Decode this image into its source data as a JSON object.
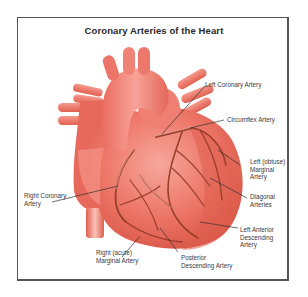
{
  "title": "Coronary Arteries of the Heart",
  "colors": {
    "heart_light": "#f48a80",
    "heart_mid": "#e8675a",
    "heart_dark": "#c9473a",
    "artery": "#9a3f2c",
    "frame": "#555555",
    "text": "#3a3a3a"
  },
  "labels": {
    "left_coronary_artery": "Left Coronary Artery",
    "circumflex_artery": "Circumflex Artery",
    "left_obtuse_marginal": "Left (obtuse)\nMarginal\nArtery",
    "diagonal_arteries": "Diagonal\nArteries",
    "left_anterior_descending": "Left Anterior\nDescending\nArtery",
    "right_coronary_artery": "Right Coronary\nArtery",
    "right_acute_marginal": "Right (acute)\nMarginal Artery",
    "posterior_descending": "Posterior\nDescending Artery"
  }
}
